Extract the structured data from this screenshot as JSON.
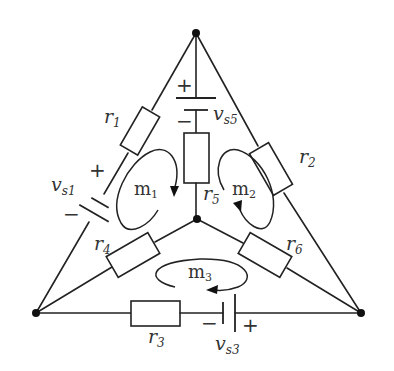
{
  "diagram": {
    "type": "circuit",
    "title": "",
    "nodes": [
      {
        "id": "top",
        "x": 196,
        "y": 33
      },
      {
        "id": "bottom-left",
        "x": 36,
        "y": 313
      },
      {
        "id": "bottom-right",
        "x": 361,
        "y": 313
      },
      {
        "id": "center",
        "x": 197,
        "y": 219
      }
    ],
    "resistors": {
      "r1": {
        "main": "r",
        "sub": "1"
      },
      "r2": {
        "main": "r",
        "sub": "2"
      },
      "r3": {
        "main": "r",
        "sub": "3"
      },
      "r4": {
        "main": "r",
        "sub": "4"
      },
      "r5": {
        "main": "r",
        "sub": "5"
      },
      "r6": {
        "main": "r",
        "sub": "6"
      }
    },
    "sources": {
      "vs1": {
        "main": "v",
        "sub": "s1",
        "plus": "+",
        "minus": "−"
      },
      "vs3": {
        "main": "v",
        "sub": "s3",
        "plus": "+",
        "minus": "−"
      },
      "vs5": {
        "main": "v",
        "sub": "s5",
        "plus": "+",
        "minus": "−"
      }
    },
    "meshes": {
      "m1": {
        "main": "m",
        "sub": "1",
        "direction": "clockwise"
      },
      "m2": {
        "main": "m",
        "sub": "2",
        "direction": "counterclockwise"
      },
      "m3": {
        "main": "m",
        "sub": "3",
        "direction": "clockwise"
      }
    },
    "branches": [
      {
        "from": "top",
        "to": "bottom-left",
        "elements": [
          "r1",
          "vs1"
        ]
      },
      {
        "from": "top",
        "to": "bottom-right",
        "elements": [
          "r2"
        ]
      },
      {
        "from": "bottom-left",
        "to": "bottom-right",
        "elements": [
          "r3",
          "vs3"
        ]
      },
      {
        "from": "center",
        "to": "bottom-left",
        "elements": [
          "r4"
        ]
      },
      {
        "from": "top",
        "to": "center",
        "elements": [
          "vs5",
          "r5"
        ]
      },
      {
        "from": "center",
        "to": "bottom-right",
        "elements": [
          "r6"
        ]
      }
    ]
  }
}
